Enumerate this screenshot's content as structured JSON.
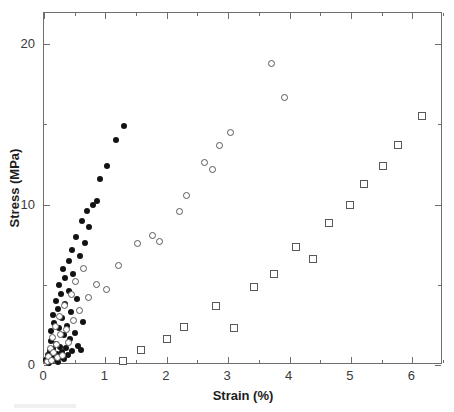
{
  "figure": {
    "width": 454,
    "height": 412,
    "background": "#ffffff",
    "frame_color": "#6e6e6e"
  },
  "axes": {
    "x": {
      "title": "Strain (%)",
      "min": 0,
      "max": 6.5,
      "major_ticks": [
        0,
        1,
        2,
        3,
        4,
        5,
        6
      ],
      "major_tick_labels": [
        "0",
        "1",
        "2",
        "3",
        "4",
        "5",
        "6"
      ],
      "minor_ticks": [
        0.5,
        1.5,
        2.5,
        3.5,
        4.5,
        5.5,
        6.5
      ]
    },
    "y": {
      "title": "Stress (MPa)",
      "min": 0,
      "max": 21.95,
      "major_ticks": [
        0,
        10,
        20
      ],
      "major_tick_labels": [
        "0",
        "10",
        "20"
      ],
      "minor_ticks": [
        5,
        15
      ]
    }
  },
  "chart_data": {
    "type": "scatter",
    "title": "",
    "xlabel": "Strain (%)",
    "ylabel": "Stress (MPa)",
    "xlim": [
      0,
      6.5
    ],
    "ylim": [
      0,
      21.95
    ],
    "grid": false,
    "legend": "none",
    "series": [
      {
        "name": "filled-circles",
        "marker": "filled-circle",
        "color": "#131313",
        "points": [
          [
            0.04,
            0.3
          ],
          [
            0.06,
            0.6
          ],
          [
            0.08,
            0.15
          ],
          [
            0.09,
            0.9
          ],
          [
            0.1,
            0.45
          ],
          [
            0.11,
            1.5
          ],
          [
            0.12,
            2.1
          ],
          [
            0.13,
            0.25
          ],
          [
            0.14,
            3.1
          ],
          [
            0.15,
            1.0
          ],
          [
            0.16,
            0.55
          ],
          [
            0.17,
            2.6
          ],
          [
            0.18,
            0.35
          ],
          [
            0.19,
            4.0
          ],
          [
            0.2,
            1.3
          ],
          [
            0.21,
            0.7
          ],
          [
            0.22,
            3.5
          ],
          [
            0.23,
            0.2
          ],
          [
            0.24,
            2.3
          ],
          [
            0.25,
            5.0
          ],
          [
            0.26,
            1.1
          ],
          [
            0.27,
            0.5
          ],
          [
            0.28,
            4.4
          ],
          [
            0.29,
            2.9
          ],
          [
            0.3,
            0.8
          ],
          [
            0.31,
            6.0
          ],
          [
            0.32,
            1.9
          ],
          [
            0.33,
            0.4
          ],
          [
            0.34,
            3.8
          ],
          [
            0.35,
            5.4
          ],
          [
            0.36,
            1.05
          ],
          [
            0.38,
            2.45
          ],
          [
            0.39,
            0.65
          ],
          [
            0.4,
            6.5
          ],
          [
            0.41,
            4.6
          ],
          [
            0.42,
            1.6
          ],
          [
            0.44,
            3.3
          ],
          [
            0.45,
            0.85
          ],
          [
            0.46,
            7.2
          ],
          [
            0.48,
            5.7
          ],
          [
            0.5,
            2.0
          ],
          [
            0.52,
            8.0
          ],
          [
            0.54,
            4.1
          ],
          [
            0.55,
            1.2
          ],
          [
            0.58,
            6.8
          ],
          [
            0.6,
            0.95
          ],
          [
            0.62,
            9.0
          ],
          [
            0.64,
            2.7
          ],
          [
            0.66,
            7.6
          ],
          [
            0.7,
            9.6
          ],
          [
            0.74,
            8.6
          ],
          [
            0.8,
            10.0
          ],
          [
            0.86,
            10.2
          ],
          [
            0.92,
            11.6
          ],
          [
            1.02,
            12.4
          ],
          [
            1.18,
            14.0
          ],
          [
            1.3,
            14.9
          ]
        ]
      },
      {
        "name": "open-circles",
        "marker": "open-circle",
        "color": "#585858",
        "points": [
          [
            0.05,
            0.2
          ],
          [
            0.07,
            0.55
          ],
          [
            0.1,
            1.0
          ],
          [
            0.12,
            0.3
          ],
          [
            0.14,
            1.7
          ],
          [
            0.16,
            0.75
          ],
          [
            0.18,
            2.4
          ],
          [
            0.2,
            1.25
          ],
          [
            0.22,
            0.45
          ],
          [
            0.25,
            3.0
          ],
          [
            0.27,
            1.9
          ],
          [
            0.3,
            0.6
          ],
          [
            0.33,
            3.7
          ],
          [
            0.36,
            2.2
          ],
          [
            0.4,
            1.4
          ],
          [
            0.44,
            4.4
          ],
          [
            0.48,
            2.8
          ],
          [
            0.52,
            5.2
          ],
          [
            0.58,
            3.4
          ],
          [
            0.64,
            6.0
          ],
          [
            0.72,
            4.2
          ],
          [
            0.86,
            5.0
          ],
          [
            1.02,
            4.7
          ],
          [
            1.22,
            6.2
          ],
          [
            1.52,
            7.6
          ],
          [
            1.76,
            8.1
          ],
          [
            1.88,
            7.7
          ],
          [
            2.2,
            9.6
          ],
          [
            2.32,
            10.6
          ],
          [
            2.62,
            12.6
          ],
          [
            2.74,
            12.2
          ],
          [
            2.86,
            13.7
          ],
          [
            3.04,
            14.5
          ],
          [
            3.7,
            18.8
          ],
          [
            3.92,
            16.7
          ]
        ]
      },
      {
        "name": "open-squares",
        "marker": "open-square",
        "color": "#585858",
        "points": [
          [
            1.28,
            0.28
          ],
          [
            1.58,
            0.95
          ],
          [
            2.0,
            1.65
          ],
          [
            2.28,
            2.35
          ],
          [
            2.8,
            3.7
          ],
          [
            3.1,
            2.3
          ],
          [
            3.42,
            4.85
          ],
          [
            3.75,
            5.7
          ],
          [
            4.1,
            7.35
          ],
          [
            4.38,
            6.6
          ],
          [
            4.64,
            8.85
          ],
          [
            4.98,
            9.95
          ],
          [
            5.22,
            11.3
          ],
          [
            5.52,
            12.4
          ],
          [
            5.76,
            13.7
          ],
          [
            6.16,
            15.55
          ]
        ]
      }
    ]
  }
}
